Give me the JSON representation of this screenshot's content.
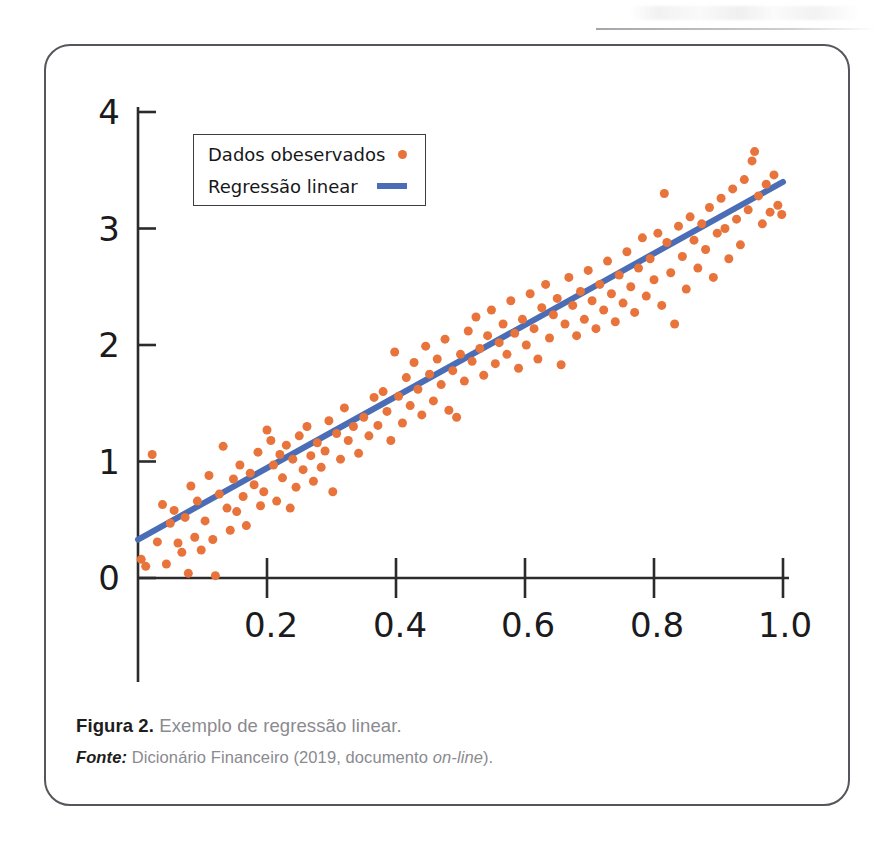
{
  "figure": {
    "frame_color": "#54565b",
    "caption": {
      "label": "Figura 2.",
      "title": " Exemplo de regressão linear.",
      "source_label": "Fonte:",
      "source_text_before": " Dicionário Financeiro (2019, documento ",
      "source_italic": "on-line",
      "source_text_after": ")."
    }
  },
  "legend": {
    "items": [
      {
        "label": "Dados obeservados",
        "marker": "dot-marker-icon",
        "color": "#e8743b"
      },
      {
        "label": "Regressão linear",
        "marker": "line-marker-icon",
        "color": "#4a6db5"
      }
    ]
  },
  "chart_data": {
    "type": "scatter",
    "title": "",
    "xlabel": "",
    "ylabel": "",
    "xlim": [
      0.0,
      1.04
    ],
    "ylim": [
      0.0,
      4.0
    ],
    "xticks": [
      0.2,
      0.4,
      0.6,
      0.8,
      1.0
    ],
    "xticklabels": [
      "0.2",
      "0.4",
      "0.6",
      "0.8",
      "1.0"
    ],
    "yticks": [
      0,
      1,
      2,
      3,
      4
    ],
    "yticklabels": [
      "0",
      "1",
      "2",
      "3",
      "4"
    ],
    "grid": false,
    "legend_position": "upper left",
    "series": [
      {
        "name": "Dados obeservados",
        "type": "scatter",
        "color": "#e8743b",
        "marker_size": 9,
        "points": [
          [
            0.005,
            0.16
          ],
          [
            0.012,
            0.1
          ],
          [
            0.022,
            1.06
          ],
          [
            0.03,
            0.31
          ],
          [
            0.038,
            0.63
          ],
          [
            0.044,
            0.12
          ],
          [
            0.05,
            0.47
          ],
          [
            0.056,
            0.58
          ],
          [
            0.062,
            0.3
          ],
          [
            0.068,
            0.22
          ],
          [
            0.073,
            0.52
          ],
          [
            0.078,
            0.04
          ],
          [
            0.082,
            0.79
          ],
          [
            0.088,
            0.35
          ],
          [
            0.092,
            0.66
          ],
          [
            0.098,
            0.24
          ],
          [
            0.104,
            0.49
          ],
          [
            0.11,
            0.88
          ],
          [
            0.116,
            0.33
          ],
          [
            0.12,
            0.02
          ],
          [
            0.126,
            0.72
          ],
          [
            0.132,
            1.13
          ],
          [
            0.138,
            0.6
          ],
          [
            0.143,
            0.41
          ],
          [
            0.148,
            0.85
          ],
          [
            0.153,
            0.57
          ],
          [
            0.158,
            0.97
          ],
          [
            0.163,
            0.7
          ],
          [
            0.168,
            0.45
          ],
          [
            0.174,
            0.9
          ],
          [
            0.18,
            0.8
          ],
          [
            0.186,
            1.08
          ],
          [
            0.19,
            0.62
          ],
          [
            0.195,
            0.74
          ],
          [
            0.2,
            1.27
          ],
          [
            0.206,
            1.18
          ],
          [
            0.21,
            0.97
          ],
          [
            0.215,
            0.66
          ],
          [
            0.22,
            1.06
          ],
          [
            0.224,
            0.86
          ],
          [
            0.23,
            1.14
          ],
          [
            0.236,
            0.6
          ],
          [
            0.24,
            1.02
          ],
          [
            0.245,
            0.78
          ],
          [
            0.25,
            1.22
          ],
          [
            0.256,
            0.93
          ],
          [
            0.262,
            1.3
          ],
          [
            0.268,
            1.05
          ],
          [
            0.272,
            0.83
          ],
          [
            0.278,
            1.16
          ],
          [
            0.284,
            0.95
          ],
          [
            0.29,
            1.09
          ],
          [
            0.296,
            1.35
          ],
          [
            0.302,
            0.74
          ],
          [
            0.308,
            1.24
          ],
          [
            0.314,
            1.02
          ],
          [
            0.32,
            1.46
          ],
          [
            0.326,
            1.18
          ],
          [
            0.334,
            1.3
          ],
          [
            0.342,
            1.07
          ],
          [
            0.35,
            1.38
          ],
          [
            0.358,
            1.22
          ],
          [
            0.366,
            1.55
          ],
          [
            0.372,
            1.31
          ],
          [
            0.38,
            1.6
          ],
          [
            0.386,
            1.43
          ],
          [
            0.392,
            1.18
          ],
          [
            0.398,
            1.94
          ],
          [
            0.404,
            1.56
          ],
          [
            0.41,
            1.33
          ],
          [
            0.416,
            1.72
          ],
          [
            0.422,
            1.48
          ],
          [
            0.428,
            1.85
          ],
          [
            0.434,
            1.62
          ],
          [
            0.44,
            1.4
          ],
          [
            0.446,
            1.99
          ],
          [
            0.452,
            1.75
          ],
          [
            0.458,
            1.52
          ],
          [
            0.464,
            1.88
          ],
          [
            0.47,
            1.66
          ],
          [
            0.476,
            2.05
          ],
          [
            0.482,
            1.44
          ],
          [
            0.488,
            1.78
          ],
          [
            0.494,
            1.38
          ],
          [
            0.5,
            1.92
          ],
          [
            0.506,
            1.69
          ],
          [
            0.512,
            2.12
          ],
          [
            0.518,
            1.86
          ],
          [
            0.524,
            2.24
          ],
          [
            0.53,
            1.97
          ],
          [
            0.536,
            1.74
          ],
          [
            0.542,
            2.08
          ],
          [
            0.548,
            2.3
          ],
          [
            0.554,
            1.84
          ],
          [
            0.56,
            2.02
          ],
          [
            0.566,
            2.18
          ],
          [
            0.572,
            1.92
          ],
          [
            0.578,
            2.38
          ],
          [
            0.584,
            2.1
          ],
          [
            0.59,
            1.8
          ],
          [
            0.596,
            2.22
          ],
          [
            0.602,
            2.0
          ],
          [
            0.608,
            2.44
          ],
          [
            0.614,
            2.14
          ],
          [
            0.62,
            1.88
          ],
          [
            0.626,
            2.32
          ],
          [
            0.632,
            2.52
          ],
          [
            0.638,
            2.06
          ],
          [
            0.644,
            2.26
          ],
          [
            0.65,
            2.4
          ],
          [
            0.656,
            1.83
          ],
          [
            0.662,
            2.18
          ],
          [
            0.668,
            2.58
          ],
          [
            0.674,
            2.34
          ],
          [
            0.68,
            2.08
          ],
          [
            0.686,
            2.46
          ],
          [
            0.692,
            2.22
          ],
          [
            0.698,
            2.64
          ],
          [
            0.704,
            2.38
          ],
          [
            0.71,
            2.14
          ],
          [
            0.716,
            2.52
          ],
          [
            0.722,
            2.3
          ],
          [
            0.728,
            2.72
          ],
          [
            0.734,
            2.44
          ],
          [
            0.74,
            2.2
          ],
          [
            0.746,
            2.6
          ],
          [
            0.752,
            2.36
          ],
          [
            0.758,
            2.8
          ],
          [
            0.764,
            2.5
          ],
          [
            0.77,
            2.28
          ],
          [
            0.776,
            2.66
          ],
          [
            0.782,
            2.92
          ],
          [
            0.788,
            2.42
          ],
          [
            0.794,
            2.74
          ],
          [
            0.8,
            2.56
          ],
          [
            0.806,
            2.96
          ],
          [
            0.812,
            2.34
          ],
          [
            0.816,
            3.3
          ],
          [
            0.82,
            2.88
          ],
          [
            0.826,
            2.62
          ],
          [
            0.832,
            2.18
          ],
          [
            0.838,
            3.02
          ],
          [
            0.844,
            2.76
          ],
          [
            0.85,
            2.48
          ],
          [
            0.856,
            3.1
          ],
          [
            0.862,
            2.9
          ],
          [
            0.868,
            2.66
          ],
          [
            0.874,
            3.04
          ],
          [
            0.88,
            2.82
          ],
          [
            0.886,
            3.18
          ],
          [
            0.892,
            2.58
          ],
          [
            0.898,
            2.96
          ],
          [
            0.904,
            3.26
          ],
          [
            0.91,
            3.0
          ],
          [
            0.916,
            2.74
          ],
          [
            0.922,
            3.34
          ],
          [
            0.928,
            3.08
          ],
          [
            0.934,
            2.86
          ],
          [
            0.94,
            3.42
          ],
          [
            0.946,
            3.16
          ],
          [
            0.952,
            3.58
          ],
          [
            0.956,
            3.66
          ],
          [
            0.962,
            3.28
          ],
          [
            0.968,
            3.04
          ],
          [
            0.974,
            3.38
          ],
          [
            0.98,
            3.14
          ],
          [
            0.986,
            3.46
          ],
          [
            0.992,
            3.2
          ],
          [
            0.998,
            3.12
          ]
        ]
      },
      {
        "name": "Regressão linear",
        "type": "line",
        "color": "#4a6db5",
        "line_width": 6,
        "intercept": 0.33,
        "slope": 3.07,
        "endpoints": [
          [
            0.0,
            0.33
          ],
          [
            1.0,
            3.4
          ]
        ]
      }
    ]
  }
}
